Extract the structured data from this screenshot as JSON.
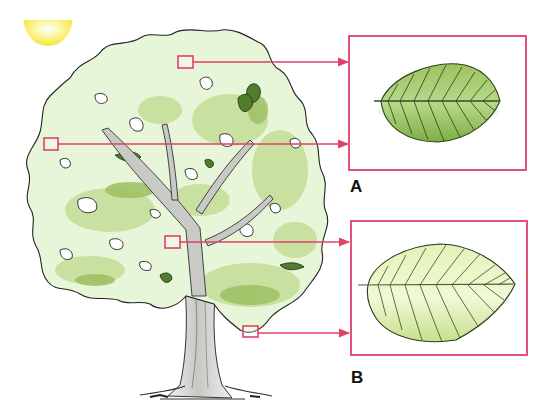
{
  "diagram": {
    "colors": {
      "accent": "#e0416a",
      "sun": "#f7ec55",
      "canopy_light": "#e6f4d6",
      "canopy_mid": "#c6df9a",
      "canopy_dark": "#8fb356",
      "bark": "#c9c9c6",
      "leaf_a_fill": "#97c05a",
      "leaf_b_fill": "#d9eea7"
    },
    "icons": {
      "sun": "sun-icon",
      "tree": "tree-illustration",
      "leaf_a": "sun-leaf-icon",
      "leaf_b": "shade-leaf-icon"
    },
    "panels": [
      {
        "id": "A",
        "label": "A",
        "description": "sun leaf (darker green, smaller, thicker)"
      },
      {
        "id": "B",
        "label": "B",
        "description": "shade leaf (pale green, larger, thinner)"
      }
    ],
    "callouts": [
      {
        "marker": "top-canopy",
        "target": "A"
      },
      {
        "marker": "left-edge-canopy",
        "target": "A"
      },
      {
        "marker": "inner-canopy",
        "target": "B"
      },
      {
        "marker": "lower-canopy",
        "target": "B"
      }
    ]
  }
}
